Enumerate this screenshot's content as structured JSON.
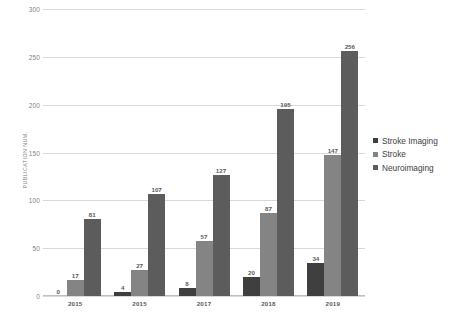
{
  "chart_data": {
    "type": "bar",
    "title": "",
    "xlabel": "",
    "ylabel": "PUBLICATION NUM.",
    "ylim": [
      0,
      300
    ],
    "ytick_step": 50,
    "yticks": [
      "0",
      "50",
      "100",
      "150",
      "200",
      "250",
      "300"
    ],
    "grid": true,
    "legend_position": "right",
    "categories": [
      "2015",
      "2015",
      "2017",
      "2018",
      "2019"
    ],
    "series": [
      {
        "name": "Stroke Imaging",
        "color": "#3f3f3f",
        "values": [
          0,
          4,
          8,
          20,
          34
        ],
        "labels": [
          "0",
          "4",
          "8",
          "20",
          "34"
        ]
      },
      {
        "name": "Stroke",
        "color": "#848484",
        "values": [
          17,
          27,
          57,
          87,
          147
        ],
        "labels": [
          "17",
          "27",
          "57",
          "87",
          "147"
        ]
      },
      {
        "name": "Neuroimaging",
        "color": "#5c5c5c",
        "values": [
          81,
          107,
          127,
          195,
          256
        ],
        "labels": [
          "81",
          "107",
          "127",
          "195",
          "256"
        ]
      }
    ]
  },
  "legend": {
    "items": [
      {
        "label": "Stroke Imaging"
      },
      {
        "label": "Stroke"
      },
      {
        "label": "Neuroimaging"
      }
    ]
  },
  "axes": {
    "y_title": "PUBLICATION NUM.",
    "y_ticks": [
      "300",
      "250",
      "200",
      "150",
      "100",
      "50",
      "0"
    ],
    "x_ticks": [
      "2015",
      "2015",
      "2017",
      "2018",
      "2019"
    ]
  }
}
